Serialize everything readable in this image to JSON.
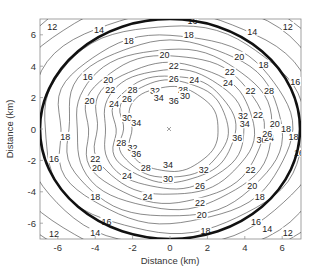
{
  "chart_data": {
    "type": "contour",
    "title": "",
    "xlabel": "Distance (km)",
    "ylabel": "Distance (km)",
    "xlim": [
      -7,
      7
    ],
    "ylim": [
      -7,
      7
    ],
    "xticks": [
      -6,
      -4,
      -2,
      0,
      2,
      4,
      6
    ],
    "yticks": [
      -6,
      -4,
      -2,
      0,
      2,
      4,
      6
    ],
    "grid": false,
    "center_marker": {
      "x": 0,
      "y": 0,
      "symbol": "x"
    },
    "contour_levels": [
      12,
      14,
      16,
      18,
      20,
      22,
      24,
      26,
      28,
      30,
      32,
      34,
      36
    ],
    "contours": [
      {
        "level": 36,
        "rx_km": 2.6,
        "ry_km": 2.7
      },
      {
        "level": 34,
        "rx_km": 3.1,
        "ry_km": 3.1
      },
      {
        "level": 32,
        "rx_km": 3.5,
        "ry_km": 3.4
      },
      {
        "level": 30,
        "rx_km": 4.0,
        "ry_km": 3.8
      },
      {
        "level": 28,
        "rx_km": 4.5,
        "ry_km": 4.2
      },
      {
        "level": 26,
        "rx_km": 5.0,
        "ry_km": 4.7
      },
      {
        "level": 24,
        "rx_km": 5.5,
        "ry_km": 5.1
      },
      {
        "level": 22,
        "rx_km": 6.0,
        "ry_km": 5.6
      },
      {
        "level": 20,
        "rx_km": 6.5,
        "ry_km": 6.0
      },
      {
        "level": 18,
        "rx_km": 7.2,
        "ry_km": 6.6
      },
      {
        "level": 16,
        "rx_km": 8.0,
        "ry_km": 7.4
      },
      {
        "level": 14,
        "rx_km": 9.0,
        "ry_km": 8.3
      },
      {
        "level": 12,
        "rx_km": 10.0,
        "ry_km": 9.2
      }
    ],
    "highlight_contour": {
      "description": "thick boundary ellipse",
      "rx_km": 7.0,
      "ry_km": 7.0
    },
    "contour_labels": [
      {
        "text": "12",
        "x": -6.3,
        "y": 6.5
      },
      {
        "text": "14",
        "x": -3.8,
        "y": 6.3
      },
      {
        "text": "16",
        "x": 1.2,
        "y": 6.9
      },
      {
        "text": "18",
        "x": 1.0,
        "y": 6.0
      },
      {
        "text": "14",
        "x": 4.4,
        "y": 6.2
      },
      {
        "text": "12",
        "x": 6.3,
        "y": 6.5
      },
      {
        "text": "18",
        "x": -2.2,
        "y": 5.6
      },
      {
        "text": "20",
        "x": -0.3,
        "y": 4.7
      },
      {
        "text": "22",
        "x": 0.2,
        "y": 4.0
      },
      {
        "text": "24",
        "x": 1.3,
        "y": 3.1
      },
      {
        "text": "26",
        "x": 0.2,
        "y": 3.2
      },
      {
        "text": "20",
        "x": 3.7,
        "y": 4.6
      },
      {
        "text": "24",
        "x": 3.1,
        "y": 2.9
      },
      {
        "text": "28",
        "x": 0.7,
        "y": 2.5
      },
      {
        "text": "30",
        "x": 0.8,
        "y": 2.1
      },
      {
        "text": "36",
        "x": 0.2,
        "y": 1.8
      },
      {
        "text": "16",
        "x": -4.4,
        "y": 3.3
      },
      {
        "text": "20",
        "x": -3.3,
        "y": 3.1
      },
      {
        "text": "22",
        "x": -3.2,
        "y": 2.5
      },
      {
        "text": "20",
        "x": -4.3,
        "y": 1.8
      },
      {
        "text": "24",
        "x": -3.0,
        "y": 1.6
      },
      {
        "text": "26",
        "x": -2.3,
        "y": 1.9
      },
      {
        "text": "28",
        "x": -2.0,
        "y": 2.5
      },
      {
        "text": "32",
        "x": -0.8,
        "y": 2.4
      },
      {
        "text": "34",
        "x": -0.6,
        "y": 2.0
      },
      {
        "text": "30",
        "x": -2.3,
        "y": 0.7
      },
      {
        "text": "34",
        "x": -1.8,
        "y": 0.4
      },
      {
        "text": "18",
        "x": -5.6,
        "y": -0.5
      },
      {
        "text": "28",
        "x": -2.6,
        "y": -0.9
      },
      {
        "text": "32",
        "x": -2.0,
        "y": -1.2
      },
      {
        "text": "36",
        "x": -1.8,
        "y": -1.6
      },
      {
        "text": "22",
        "x": -4.0,
        "y": -1.9
      },
      {
        "text": "20",
        "x": -3.9,
        "y": -2.5
      },
      {
        "text": "24",
        "x": -2.3,
        "y": -3.0
      },
      {
        "text": "28",
        "x": -1.3,
        "y": -2.5
      },
      {
        "text": "30",
        "x": -0.1,
        "y": -3.2
      },
      {
        "text": "16",
        "x": -6.2,
        "y": -1.9
      },
      {
        "text": "18",
        "x": -4.0,
        "y": -4.3
      },
      {
        "text": "16",
        "x": -3.4,
        "y": -5.9
      },
      {
        "text": "22",
        "x": 1.6,
        "y": -4.7
      },
      {
        "text": "20",
        "x": 1.7,
        "y": -5.5
      },
      {
        "text": "18",
        "x": 1.9,
        "y": -6.5
      },
      {
        "text": "14",
        "x": -4.0,
        "y": -6.6
      },
      {
        "text": "12",
        "x": -6.2,
        "y": -6.7
      },
      {
        "text": "34",
        "x": -0.1,
        "y": -2.3
      },
      {
        "text": "32",
        "x": 1.8,
        "y": -2.6
      },
      {
        "text": "26",
        "x": 1.6,
        "y": -3.6
      },
      {
        "text": "24",
        "x": -1.2,
        "y": -4.3
      },
      {
        "text": "36",
        "x": 3.6,
        "y": -0.6
      },
      {
        "text": "30",
        "x": 4.9,
        "y": -0.7
      },
      {
        "text": "28",
        "x": 5.3,
        "y": -0.6
      },
      {
        "text": "24",
        "x": 5.3,
        "y": -0.6
      },
      {
        "text": "22",
        "x": 4.3,
        "y": -2.6
      },
      {
        "text": "20",
        "x": 4.4,
        "y": -3.6
      },
      {
        "text": "18",
        "x": 4.8,
        "y": -4.3
      },
      {
        "text": "16",
        "x": 4.6,
        "y": -5.9
      },
      {
        "text": "14",
        "x": 5.2,
        "y": -6.4
      },
      {
        "text": "12",
        "x": 6.3,
        "y": -6.6
      },
      {
        "text": "18",
        "x": 6.6,
        "y": -0.5
      },
      {
        "text": "16",
        "x": 6.9,
        "y": -1.5
      },
      {
        "text": "32",
        "x": 3.9,
        "y": 0.8
      },
      {
        "text": "34",
        "x": 4.0,
        "y": 0.3
      },
      {
        "text": "26",
        "x": 5.2,
        "y": -0.3
      },
      {
        "text": "22",
        "x": 4.7,
        "y": 0.9
      },
      {
        "text": "20",
        "x": 5.6,
        "y": 0.3
      },
      {
        "text": "28",
        "x": 5.3,
        "y": 2.4
      },
      {
        "text": "22",
        "x": 4.3,
        "y": 2.4
      },
      {
        "text": "18",
        "x": 6.2,
        "y": 0.0
      },
      {
        "text": "16",
        "x": 6.7,
        "y": 3.0
      },
      {
        "text": "18",
        "x": 5.0,
        "y": 4.1
      },
      {
        "text": "22",
        "x": 3.2,
        "y": 3.6
      }
    ]
  },
  "axes": {
    "xlabel": "Distance (km)",
    "ylabel": "Distance (km)",
    "xticks": [
      "-6",
      "-4",
      "-2",
      "0",
      "2",
      "4",
      "6"
    ],
    "yticks": [
      "6",
      "4",
      "2",
      "0",
      "-2",
      "-4",
      "-6"
    ]
  }
}
